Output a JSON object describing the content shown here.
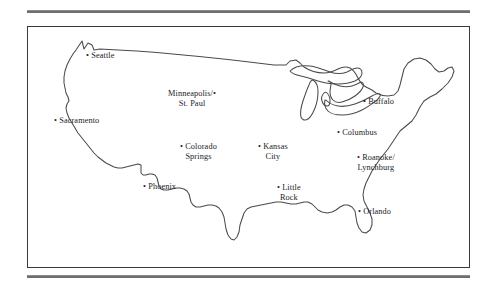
{
  "figure": {
    "type": "map",
    "region": "Contiguous United States",
    "style": "outline map with labeled city markers",
    "rules": {
      "top_rule": "horizontal-rule",
      "bottom_rule": "horizontal-rule"
    }
  },
  "map": {
    "frame_color": "#3a3a3c",
    "outline_color": "#4a4a4d",
    "background": "#ffffff",
    "marker_glyph": "•"
  },
  "cities": [
    {
      "name": "Seattle",
      "label_lines": [
        "Seattle"
      ],
      "dot_side": "left",
      "x": 58,
      "y": 24
    },
    {
      "name": "Sacramento",
      "label_lines": [
        "Sacramento"
      ],
      "dot_side": "left",
      "x": 26,
      "y": 89
    },
    {
      "name": "Minneapolis/St. Paul",
      "label_lines": [
        "Minneapolis/",
        "St. Paul"
      ],
      "dot_side": "right",
      "x": 140,
      "y": 62
    },
    {
      "name": "Buffalo",
      "label_lines": [
        "Buffalo"
      ],
      "dot_side": "left",
      "x": 335,
      "y": 70
    },
    {
      "name": "Columbus",
      "label_lines": [
        "Columbus"
      ],
      "dot_side": "left",
      "x": 309,
      "y": 101
    },
    {
      "name": "Colorado Springs",
      "label_lines": [
        "Colorado",
        "Springs"
      ],
      "dot_side": "left",
      "x": 152,
      "y": 115
    },
    {
      "name": "Kansas City",
      "label_lines": [
        "Kansas",
        "City"
      ],
      "dot_side": "left",
      "x": 230,
      "y": 115
    },
    {
      "name": "Roanoke/Lynchburg",
      "label_lines": [
        "Roanoke/",
        "Lynchburg"
      ],
      "dot_side": "left",
      "x": 329,
      "y": 126
    },
    {
      "name": "Phoenix",
      "label_lines": [
        "Phoenix"
      ],
      "dot_side": "left",
      "x": 115,
      "y": 155
    },
    {
      "name": "Little Rock",
      "label_lines": [
        "Little",
        "Rock"
      ],
      "dot_side": "left",
      "x": 249,
      "y": 156
    },
    {
      "name": "Orlando",
      "label_lines": [
        "Orlando"
      ],
      "dot_side": "left",
      "x": 330,
      "y": 180
    }
  ]
}
